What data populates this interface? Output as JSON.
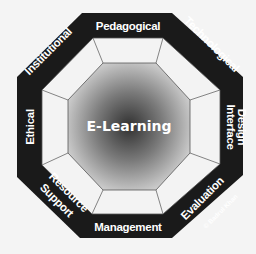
{
  "diagram": {
    "center_label": "E-Learning",
    "dimensions": [
      {
        "name": "Pedagogical",
        "position": "top"
      },
      {
        "name": "Technological",
        "position": "top-right"
      },
      {
        "name": "Interface",
        "name_line2": "Design",
        "position": "right"
      },
      {
        "name": "Evaluation",
        "position": "bottom-right"
      },
      {
        "name": "Management",
        "position": "bottom"
      },
      {
        "name": "Resource",
        "name_line2": "Support",
        "position": "bottom-left"
      },
      {
        "name": "Ethical",
        "position": "left"
      },
      {
        "name": "Institutional",
        "position": "top-left"
      }
    ],
    "copyright": "© Badrul Khan",
    "colors": {
      "band": "#1a1a1a",
      "panel": "#f2f2f2",
      "center_dark": "#3a3a3a",
      "center_light": "#d8d8d8"
    }
  }
}
